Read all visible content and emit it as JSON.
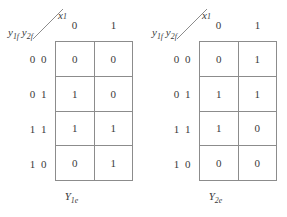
{
  "figure": {
    "type": "karnaugh-map-pair",
    "maps": [
      {
        "id": "Y1e",
        "caption_main": "Y",
        "caption_sub": "1e",
        "column_variable_main": "x",
        "column_variable_sub": "1",
        "row_variable_text": "y1f y2f",
        "row_var_parts": [
          {
            "main": "y",
            "sub": "1f"
          },
          {
            "main": "y",
            "sub": "2f"
          }
        ],
        "column_headers": [
          "0",
          "1"
        ],
        "row_headers": [
          "0 0",
          "0 1",
          "1 1",
          "1 0"
        ],
        "cells": [
          [
            "0",
            "0"
          ],
          [
            "1",
            "0"
          ],
          [
            "1",
            "1"
          ],
          [
            "0",
            "1"
          ]
        ]
      },
      {
        "id": "Y2e",
        "caption_main": "Y",
        "caption_sub": "2e",
        "column_variable_main": "x",
        "column_variable_sub": "1",
        "row_variable_text": "y1f y2f",
        "row_var_parts": [
          {
            "main": "y",
            "sub": "1f"
          },
          {
            "main": "y",
            "sub": "2f"
          }
        ],
        "column_headers": [
          "0",
          "1"
        ],
        "row_headers": [
          "0 0",
          "0 1",
          "1 1",
          "1 0"
        ],
        "cells": [
          [
            "0",
            "1"
          ],
          [
            "1",
            "1"
          ],
          [
            "1",
            "0"
          ],
          [
            "0",
            "0"
          ]
        ]
      }
    ],
    "colors": {
      "background": "#ffffff",
      "grid_line": "#8c8c8c",
      "text": "#3a3a3a"
    }
  }
}
